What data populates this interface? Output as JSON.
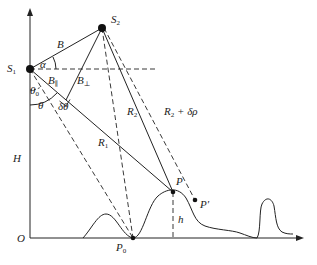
{
  "diagram": {
    "type": "InSAR geometry diagram",
    "points": {
      "S1": {
        "label": "S",
        "sub": "1",
        "x": 30,
        "y": 69
      },
      "S2": {
        "label": "S",
        "sub": "2",
        "x": 102,
        "y": 28
      },
      "P": {
        "label": "P",
        "x": 173,
        "y": 192
      },
      "P_prime": {
        "label": "P′",
        "x": 195,
        "y": 200
      },
      "P0": {
        "label": "P",
        "sub": "0",
        "x": 133,
        "y": 238
      },
      "O": {
        "label": "O",
        "x": 30,
        "y": 238
      }
    },
    "labels": {
      "B": "B",
      "alpha": "α",
      "B_parallel": "B",
      "B_parallel_sub": "∥",
      "B_perp": "B",
      "B_perp_sub": "⊥",
      "theta0": "θ",
      "theta0_sub": "0",
      "theta": "θ",
      "delta_theta": "δθ",
      "R1": "R",
      "R1_sub": "1",
      "R2": "R",
      "R2_sub": "2",
      "R2_drho": "R",
      "R2_drho_sub": "2",
      "R2_drho_suffix": " + δρ",
      "H": "H",
      "h": "h",
      "O": "O"
    },
    "colors": {
      "line": "#222222",
      "background": "#ffffff"
    }
  }
}
